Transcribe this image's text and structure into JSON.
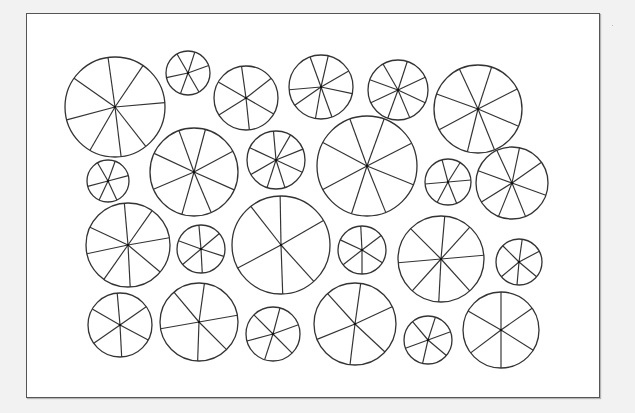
{
  "figure": {
    "background": "#f2f2f2",
    "panel_background": "#ffffff",
    "stroke_color": "#333333",
    "stroke_width": 1.3
  },
  "wheels": [
    {
      "cx": 115,
      "cy": 107,
      "r": 50,
      "spokes": [
        -98,
        -56,
        -5,
        52,
        83,
        120,
        165,
        -145
      ]
    },
    {
      "cx": 188,
      "cy": 73,
      "r": 22,
      "spokes": [
        -72,
        -20,
        60,
        110,
        168,
        -120
      ]
    },
    {
      "cx": 246,
      "cy": 98,
      "r": 32,
      "spokes": [
        -98,
        -38,
        30,
        84,
        148,
        -150
      ]
    },
    {
      "cx": 321,
      "cy": 87,
      "r": 32,
      "spokes": [
        -77,
        -30,
        12,
        70,
        100,
        145,
        175,
        -110
      ]
    },
    {
      "cx": 398,
      "cy": 90,
      "r": 30,
      "spokes": [
        -72,
        -25,
        25,
        67,
        110,
        155,
        -160,
        -120
      ]
    },
    {
      "cx": 478,
      "cy": 109,
      "r": 44,
      "spokes": [
        -72,
        -27,
        23,
        68,
        104,
        152,
        -160,
        -115
      ]
    },
    {
      "cx": 108,
      "cy": 181,
      "r": 21,
      "spokes": [
        -70,
        -15,
        65,
        115,
        165,
        -120
      ]
    },
    {
      "cx": 194,
      "cy": 172,
      "r": 44,
      "spokes": [
        -75,
        -28,
        24,
        67,
        106,
        157,
        -155,
        -110
      ]
    },
    {
      "cx": 276,
      "cy": 160,
      "r": 29,
      "spokes": [
        -60,
        -22,
        25,
        72,
        108,
        150,
        -155,
        -95
      ]
    },
    {
      "cx": 367,
      "cy": 166,
      "r": 50,
      "spokes": [
        -70,
        -27,
        22,
        68,
        108,
        152,
        -152,
        -110
      ]
    },
    {
      "cx": 448,
      "cy": 182,
      "r": 23,
      "spokes": [
        -58,
        -5,
        68,
        118,
        175,
        -105
      ]
    },
    {
      "cx": 512,
      "cy": 183,
      "r": 36,
      "spokes": [
        -78,
        -35,
        20,
        68,
        112,
        148,
        -160,
        -115
      ]
    },
    {
      "cx": 128,
      "cy": 245,
      "r": 42,
      "spokes": [
        -95,
        -55,
        -10,
        40,
        87,
        125,
        168,
        -155
      ]
    },
    {
      "cx": 201,
      "cy": 249,
      "r": 24,
      "spokes": [
        -95,
        -40,
        18,
        87,
        140,
        -160
      ]
    },
    {
      "cx": 281,
      "cy": 245,
      "r": 49,
      "spokes": [
        -91,
        -30,
        48,
        88,
        152,
        -128
      ]
    },
    {
      "cx": 362,
      "cy": 250,
      "r": 24,
      "spokes": [
        -93,
        -37,
        32,
        90,
        142,
        -155
      ]
    },
    {
      "cx": 441,
      "cy": 259,
      "r": 43,
      "spokes": [
        -85,
        -48,
        -5,
        48,
        93,
        132,
        175,
        -135
      ]
    },
    {
      "cx": 519,
      "cy": 262,
      "r": 23,
      "spokes": [
        -82,
        -28,
        40,
        95,
        140,
        -135
      ]
    },
    {
      "cx": 120,
      "cy": 325,
      "r": 32,
      "spokes": [
        -95,
        -35,
        28,
        87,
        145,
        -150
      ]
    },
    {
      "cx": 199,
      "cy": 322,
      "r": 39,
      "spokes": [
        -82,
        -10,
        45,
        92,
        170,
        -130
      ]
    },
    {
      "cx": 273,
      "cy": 334,
      "r": 27,
      "spokes": [
        -75,
        -20,
        45,
        108,
        165,
        -135
      ]
    },
    {
      "cx": 355,
      "cy": 324,
      "r": 41,
      "spokes": [
        -82,
        -25,
        43,
        97,
        158,
        -132
      ]
    },
    {
      "cx": 428,
      "cy": 340,
      "r": 24,
      "spokes": [
        -72,
        -20,
        40,
        103,
        160,
        -130
      ]
    },
    {
      "cx": 501,
      "cy": 330,
      "r": 38,
      "spokes": [
        -90,
        -35,
        32,
        90,
        143,
        -150
      ]
    }
  ]
}
